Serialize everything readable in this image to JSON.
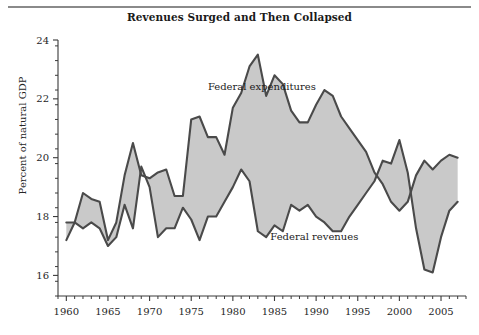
{
  "figure": {
    "title": "Revenues Surged and Then Collapsed",
    "background_color": "#ffffff",
    "rule_color": "#8a8a8a"
  },
  "chart_data": {
    "type": "area",
    "title": "Revenues Surged and Then Collapsed",
    "xlabel": "",
    "ylabel": "Percent of natural GDP",
    "xlim": [
      1959,
      2008
    ],
    "ylim": [
      15.3,
      24
    ],
    "grid": false,
    "legend_position": "inline-annotations",
    "fill_color": "#c9c9c9",
    "line_color": "#4a4a4a",
    "y_ticks": [
      16,
      18,
      20,
      22,
      24
    ],
    "y_tick_labels": [
      "16",
      "18",
      "20",
      "22",
      "24"
    ],
    "y_minor_step": 0.5,
    "x_ticks": [
      1960,
      1965,
      1970,
      1975,
      1980,
      1985,
      1990,
      1995,
      2000,
      2005
    ],
    "x_tick_labels": [
      "1960",
      "1965",
      "1970",
      "1975",
      "1980",
      "1985",
      "1990",
      "1995",
      "2000",
      "2005"
    ],
    "x_minor_step": 1,
    "annotations": [
      {
        "text": "Federal expenditures",
        "x": 1977.0,
        "y": 22.3
      },
      {
        "text": "Federal revenues",
        "x": 1984.5,
        "y": 17.2
      }
    ],
    "x": [
      1960,
      1961,
      1962,
      1963,
      1964,
      1965,
      1966,
      1967,
      1968,
      1969,
      1970,
      1971,
      1972,
      1973,
      1974,
      1975,
      1976,
      1977,
      1978,
      1979,
      1980,
      1981,
      1982,
      1983,
      1984,
      1985,
      1986,
      1987,
      1988,
      1989,
      1990,
      1991,
      1992,
      1993,
      1994,
      1995,
      1996,
      1997,
      1998,
      1999,
      2000,
      2001,
      2002,
      2003,
      2004,
      2005,
      2006,
      2007
    ],
    "series": [
      {
        "name": "Federal expenditures",
        "values": [
          17.2,
          17.8,
          18.8,
          18.6,
          18.5,
          17.2,
          17.8,
          19.4,
          20.5,
          19.4,
          19.3,
          19.5,
          19.6,
          18.7,
          18.7,
          21.3,
          21.4,
          20.7,
          20.7,
          20.1,
          21.7,
          22.2,
          23.1,
          23.5,
          22.1,
          22.8,
          22.5,
          21.6,
          21.2,
          21.2,
          21.8,
          22.3,
          22.1,
          21.4,
          21.0,
          20.6,
          20.2,
          19.5,
          19.1,
          18.5,
          18.2,
          18.5,
          19.4,
          19.9,
          19.6,
          19.9,
          20.1,
          20.0
        ]
      },
      {
        "name": "Federal revenues",
        "values": [
          17.8,
          17.8,
          17.6,
          17.8,
          17.6,
          17.0,
          17.3,
          18.4,
          17.6,
          19.7,
          19.0,
          17.3,
          17.6,
          17.6,
          18.3,
          17.9,
          17.2,
          18.0,
          18.0,
          18.5,
          19.0,
          19.6,
          19.2,
          17.5,
          17.3,
          17.7,
          17.5,
          18.4,
          18.2,
          18.4,
          18.0,
          17.8,
          17.5,
          17.5,
          18.0,
          18.4,
          18.8,
          19.2,
          19.9,
          19.8,
          20.6,
          19.5,
          17.6,
          16.2,
          16.1,
          17.3,
          18.2,
          18.5
        ]
      }
    ]
  }
}
